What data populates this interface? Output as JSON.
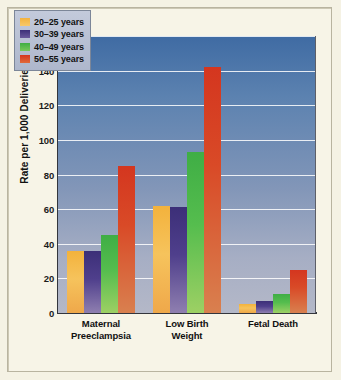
{
  "chart_data": {
    "type": "bar",
    "title": "",
    "xlabel": "",
    "ylabel": "Rate per 1,000 Deliveries",
    "ylim": [
      0,
      160
    ],
    "ytick_values": [
      0,
      20,
      40,
      60,
      80,
      100,
      120,
      140,
      160
    ],
    "ytick_labels": [
      "0",
      "20",
      "40",
      "60",
      "80",
      "100",
      "120",
      "140",
      "160"
    ],
    "grid": true,
    "legend_position": "upper left",
    "categories": [
      "Maternal Preeclampsia",
      "Low Birth Weight",
      "Fetal Death"
    ],
    "category_lines": [
      [
        "Maternal",
        "Preeclampsia"
      ],
      [
        "Low Birth",
        "Weight"
      ],
      [
        "Fetal Death"
      ]
    ],
    "series": [
      {
        "name": "20–25 years",
        "color": "#f3b23c",
        "values": [
          36,
          62,
          5
        ]
      },
      {
        "name": "30–39 years",
        "color": "#3c2f78",
        "values": [
          36,
          61,
          7
        ]
      },
      {
        "name": "40–49 years",
        "color": "#3fae45",
        "values": [
          45,
          93,
          11
        ]
      },
      {
        "name": "50–55 years",
        "color": "#d4361f",
        "values": [
          85,
          142,
          25
        ]
      }
    ]
  },
  "figure": {
    "background_color": "#f5f2e4",
    "plot_background_top": "#3f6ba3",
    "plot_background_bottom": "#b4b8c8",
    "gridline_color": "#ffffff",
    "axis_color": "#33353c"
  }
}
